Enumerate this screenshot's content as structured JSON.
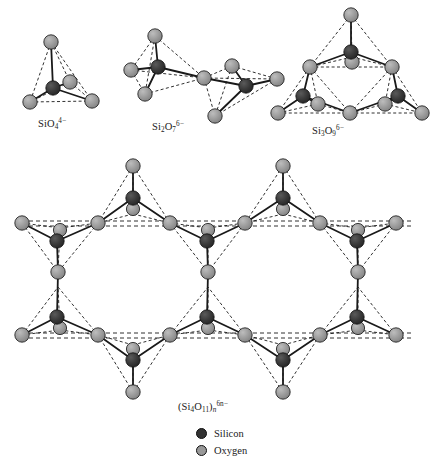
{
  "figure": {
    "background_color": "#ffffff"
  },
  "colors": {
    "silicon": "#333333",
    "oxygen": "#999999",
    "atom_outline": "#111111",
    "bond_solid": "#1a1a1a",
    "bond_dashed": "#1a1a1a"
  },
  "structures": [
    {
      "id": "sio4",
      "name": "orthosilicate-tetrahedron",
      "formula_text": "SiO4 4-",
      "parts": {
        "prefix": "SiO",
        "sub1": "4",
        "sup1": "4−"
      },
      "silicon_count": 1,
      "oxygen_count": 4,
      "description": "single tetrahedron"
    },
    {
      "id": "si2o7",
      "name": "disilicate-double-tetrahedron",
      "formula_text": "Si2O7 6-",
      "parts": {
        "prefix": "Si",
        "sub0": "2",
        "mid": "O",
        "sub1": "7",
        "sup1": "6−"
      },
      "silicon_count": 2,
      "oxygen_count": 7,
      "description": "two corner-sharing tetrahedra"
    },
    {
      "id": "si3o9",
      "name": "cyclosilicate-three-ring",
      "formula_text": "Si3O9 6-",
      "parts": {
        "prefix": "Si",
        "sub0": "3",
        "mid": "O",
        "sub1": "9",
        "sup1": "6−"
      },
      "silicon_count": 3,
      "oxygen_count": 9,
      "description": "three-membered ring of tetrahedra"
    },
    {
      "id": "si4o11n",
      "name": "inosilicate-double-chain",
      "formula_text": "(Si4O11)n 6n-",
      "parts": {
        "open": "(Si",
        "sub0": "4",
        "mid": "O",
        "sub1": "11",
        "close": ")",
        "subn": "n",
        "sup1": "6n−"
      },
      "silicon_count": 4,
      "oxygen_count": 11,
      "description": "double chain (amphibole) repeating unit"
    }
  ],
  "legend": {
    "items": [
      {
        "label": "Silicon",
        "color": "#333333",
        "swatch_name": "silicon-swatch"
      },
      {
        "label": "Oxygen",
        "color": "#999999",
        "swatch_name": "oxygen-swatch"
      }
    ]
  }
}
